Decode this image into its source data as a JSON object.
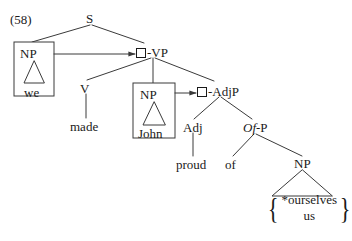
{
  "figure": {
    "example_number": "(58)",
    "sentence_gloss": "we made John proud of *ourselves / us"
  },
  "nodes": {
    "s": "S",
    "np_subject": "NP",
    "vp": "-VP",
    "v": "V",
    "np_object": "NP",
    "adjp": "-AdjP",
    "adj": "Adj",
    "ofp_italic": "Of",
    "ofp_rest": "-P",
    "np_complement": "NP"
  },
  "leaves": {
    "we": "we",
    "made": "made",
    "john": "John",
    "proud": "proud",
    "of": "of",
    "alternation_starred": "*ourselves",
    "alternation_plain": "us"
  },
  "braces": {
    "left": "{",
    "right": "}"
  },
  "colors": {
    "ink": "#1a1a1a",
    "background": "#ffffff",
    "line": "#3a3a3a"
  }
}
